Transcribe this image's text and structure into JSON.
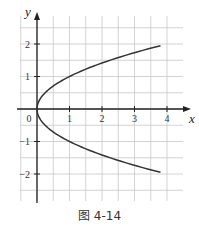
{
  "chart_data": {
    "type": "line",
    "title": "",
    "caption": "图 4-14",
    "xlabel": "x",
    "ylabel": "y",
    "xlim": [
      -0.6,
      4.6
    ],
    "ylim": [
      -2.9,
      2.9
    ],
    "grid": true,
    "grid_step": 0.5,
    "x_ticks": [
      "0",
      "1",
      "2",
      "3",
      "4"
    ],
    "y_ticks": [
      "-2",
      "-1",
      "1",
      "2"
    ],
    "origin_label": "0",
    "series": [
      {
        "name": "y² = x",
        "x": [
          3.8,
          2.89,
          2.25,
          1.44,
          1.0,
          0.49,
          0.16,
          0.04,
          0.0,
          0.04,
          0.16,
          0.49,
          1.0,
          1.44,
          2.25,
          2.89,
          3.8
        ],
        "y": [
          1.95,
          1.7,
          1.5,
          1.2,
          1.0,
          0.7,
          0.4,
          0.2,
          0.0,
          -0.2,
          -0.4,
          -0.7,
          -1.0,
          -1.2,
          -1.5,
          -1.7,
          -1.95
        ]
      }
    ]
  }
}
